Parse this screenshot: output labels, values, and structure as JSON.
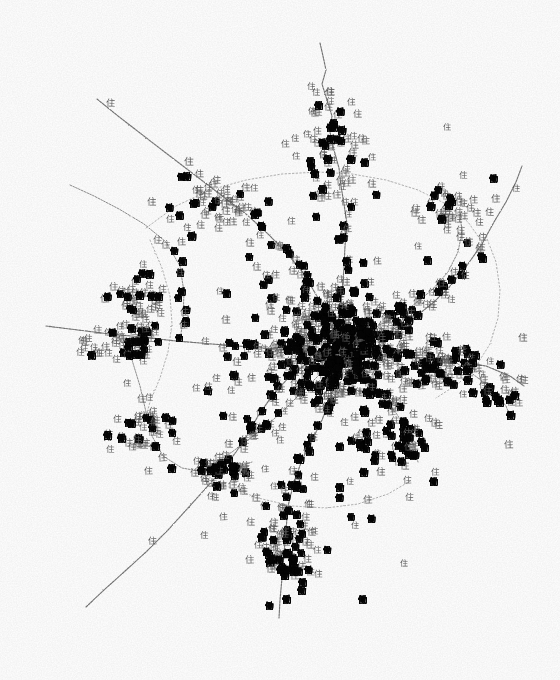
{
  "figure": {
    "name": "land-use-distribution-map",
    "medium": "scanned monochrome print",
    "background_color": "#ffffff",
    "width": 560,
    "height": 680,
    "content_bounds": {
      "x_min": 45,
      "y_min": 40,
      "x_max": 527,
      "y_max": 632
    }
  },
  "legend_symbols": [
    {
      "key": "residential",
      "glyph": "住",
      "meaning": "residential use",
      "color": "#5d5d5d",
      "weight": "regular",
      "approx_count": 470
    },
    {
      "key": "work",
      "glyph": "働",
      "meaning": "workplace / employment use",
      "color": "#050505",
      "weight": "bold",
      "approx_count": 300
    }
  ],
  "road_style": {
    "color": "#6a6a6a",
    "texture": "stippled dashed (photocopy grain)",
    "arterial_width": 1.15,
    "secondary_width": 0.95,
    "ring_width": 0.85
  },
  "chart_data": {
    "type": "scatter",
    "title": "",
    "subtitle": "",
    "xlabel": "",
    "ylabel": "",
    "xlim": [
      0,
      560
    ],
    "ylim": [
      0,
      680
    ],
    "grid": false,
    "legend_position": "none",
    "axis_visible": false,
    "core_center": [
      340,
      352
    ],
    "series": [
      {
        "name": "住",
        "glyph": "住",
        "color": "#5d5d5d",
        "marker": "cjk-glyph",
        "count": 470
      },
      {
        "name": "働",
        "glyph": "働",
        "color": "#050505",
        "marker": "cjk-glyph-bold",
        "count": 300
      }
    ],
    "density_clusters": [
      {
        "label": "central-core",
        "x": 340,
        "y": 352,
        "rx": 78,
        "ry": 62,
        "n_res": 132,
        "n_work": 126
      },
      {
        "label": "core-inner-ring",
        "x": 336,
        "y": 348,
        "rx": 128,
        "ry": 92,
        "n_res": 96,
        "n_work": 70
      },
      {
        "label": "north-corridor",
        "x": 330,
        "y": 150,
        "rx": 44,
        "ry": 62,
        "n_res": 44,
        "n_work": 16
      },
      {
        "label": "northwest-junction",
        "x": 210,
        "y": 200,
        "rx": 52,
        "ry": 34,
        "n_res": 34,
        "n_work": 10
      },
      {
        "label": "west-junction",
        "x": 140,
        "y": 300,
        "rx": 44,
        "ry": 34,
        "n_res": 32,
        "n_work": 12
      },
      {
        "label": "west-arterial",
        "x": 125,
        "y": 345,
        "rx": 52,
        "ry": 22,
        "n_res": 30,
        "n_work": 12
      },
      {
        "label": "southwest-cluster",
        "x": 145,
        "y": 430,
        "rx": 44,
        "ry": 32,
        "n_res": 28,
        "n_work": 12
      },
      {
        "label": "south-corridor",
        "x": 288,
        "y": 545,
        "rx": 40,
        "ry": 58,
        "n_res": 42,
        "n_work": 38
      },
      {
        "label": "south-junction",
        "x": 225,
        "y": 475,
        "rx": 38,
        "ry": 26,
        "n_res": 22,
        "n_work": 8
      },
      {
        "label": "east-arterial",
        "x": 440,
        "y": 370,
        "rx": 64,
        "ry": 28,
        "n_res": 30,
        "n_work": 24
      },
      {
        "label": "northeast-junction",
        "x": 455,
        "y": 205,
        "rx": 40,
        "ry": 34,
        "n_res": 30,
        "n_work": 8
      },
      {
        "label": "southeast-lobe",
        "x": 392,
        "y": 440,
        "rx": 48,
        "ry": 34,
        "n_res": 24,
        "n_work": 22
      },
      {
        "label": "far-east-tail",
        "x": 492,
        "y": 398,
        "rx": 30,
        "ry": 16,
        "n_res": 8,
        "n_work": 10
      }
    ],
    "roads": [
      {
        "id": "north-spur",
        "class": "road-arterial",
        "d": "M320,43 L323,56 L326,70 L322,84 L327,100 L332,116 L330,132 L334,150 L339,168 L341,186 L344,204 L347,224 L345,246 L344,268 L342,292 L340,318 L339,340"
      },
      {
        "id": "northwest-diagonal",
        "class": "road-arterial",
        "d": "M97,99 L118,116 L140,133 L162,150 L183,166 L204,182 L225,198 L246,214 L266,232 L286,252 L304,274 L318,298 L330,322 L338,344"
      },
      {
        "id": "west-northwest",
        "class": "road-secondary",
        "d": "M70,185 L94,196 L119,209 L144,224 L166,242 L180,266 L184,292 L183,318 L180,342"
      },
      {
        "id": "west-arterial",
        "class": "road-arterial",
        "d": "M46,326 L78,330 L110,334 L142,337 L176,341 L212,344 L250,347 L290,350 L330,352 L372,354 L412,357 L452,360 L486,366 L510,376 L524,386"
      },
      {
        "id": "west-mid-branch",
        "class": "road-secondary",
        "d": "M120,338 L132,360 L140,386 L146,412 L152,436 L163,456 L182,468 L204,472 L228,470 L252,462"
      },
      {
        "id": "southwest-tail",
        "class": "road-arterial",
        "d": "M86,607 L104,590 L124,572 L146,552 L168,530 L188,508 L206,488 L222,470 L236,452 L248,434 L258,416 L272,396 L290,376 L312,360 L332,352"
      },
      {
        "id": "south-arterial",
        "class": "road-arterial",
        "d": "M338,356 L336,378 L330,400 L322,420 L312,440 L302,460 L294,482 L288,506 L286,530 L284,554 L282,578 L280,600 L279,618"
      },
      {
        "id": "south-southwest",
        "class": "road-secondary",
        "d": "M336,356 L320,374 L302,392 L284,410 L266,426 L248,440 L232,452 L216,462 L200,472"
      },
      {
        "id": "southeast-branch",
        "class": "road-secondary",
        "d": "M342,358 L360,374 L378,392 L394,410 L406,428 L414,446 L418,462"
      },
      {
        "id": "east-northeast",
        "class": "road-arterial",
        "d": "M345,348 L368,340 L392,330 L414,318 L434,302 L452,284 L468,264 L482,244 L494,222 L506,202 L516,182 L522,166"
      },
      {
        "id": "northeast-spur",
        "class": "road-secondary",
        "d": "M344,344 L366,332 L390,320 L412,306 L432,290 L448,272 L458,252 L462,232 L460,214"
      },
      {
        "id": "east-tail",
        "class": "road-secondary",
        "d": "M452,360 L470,372 L486,384 L498,396 L506,406 L510,416"
      },
      {
        "id": "north-ring-arc",
        "class": "road-ring",
        "d": "M146,228 L176,206 L210,190 L246,180 L282,174 L318,172 L352,174 L386,180 L418,190 L446,204 L468,222 L482,242"
      },
      {
        "id": "east-ring-arc",
        "class": "road-ring",
        "d": "M486,236 L496,262 L500,290 L498,318 L490,344 L476,366 L458,384 L436,398"
      },
      {
        "id": "west-ring-arc",
        "class": "road-ring",
        "d": "M150,240 L162,268 L170,296 L172,324 L168,352 L160,378 L150,402 L144,424"
      },
      {
        "id": "south-ring-arc",
        "class": "road-ring",
        "d": "M196,470 L226,486 L258,498 L292,506 L326,508 L358,504 L388,494 L412,480"
      }
    ]
  }
}
